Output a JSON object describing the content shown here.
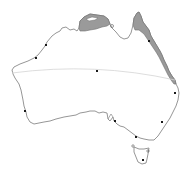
{
  "map": {
    "subject": "Australia",
    "colors": {
      "background": "#ffffff",
      "coastline": "#8a8a8a",
      "shaded_region": "#9a9a9a",
      "shaded_edge": "#6f6f6f",
      "tropic_line": "#d4d4d4",
      "city_marker": "#1a1a1a"
    },
    "shaded_regions": [
      {
        "name": "northern-coast-region"
      },
      {
        "name": "queensland-east-coast-region"
      }
    ],
    "lines": [
      {
        "name": "tropic-of-capricorn"
      }
    ],
    "markers": [
      {
        "name": "darwin",
        "x": 46,
        "y": 45
      },
      {
        "name": "cairns",
        "x": 149,
        "y": 41
      },
      {
        "name": "center",
        "x": 97,
        "y": 71
      },
      {
        "name": "brisbane",
        "x": 175,
        "y": 93
      },
      {
        "name": "perth",
        "x": 25,
        "y": 111
      },
      {
        "name": "adelaide",
        "x": 115,
        "y": 121
      },
      {
        "name": "sydney",
        "x": 162,
        "y": 122
      },
      {
        "name": "melbourne",
        "x": 136,
        "y": 137
      },
      {
        "name": "hobart",
        "x": 143,
        "y": 160
      },
      {
        "name": "port-hedland",
        "x": 36,
        "y": 58
      },
      {
        "name": "cooktown",
        "x": 112,
        "y": 26
      }
    ]
  }
}
